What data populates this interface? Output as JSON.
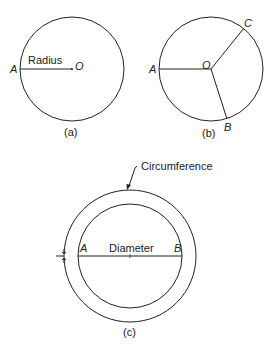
{
  "figure_a": {
    "label_radius": "Radius",
    "point_a": "A",
    "point_o": "O",
    "caption": "(a)"
  },
  "figure_b": {
    "point_a": "A",
    "point_o": "O",
    "point_b": "B",
    "point_c": "C",
    "caption": "(b)"
  },
  "figure_c": {
    "label_circumference": "Circumference",
    "label_diameter": "Diameter",
    "point_a": "A",
    "point_b": "B",
    "caption": "(c)"
  },
  "colors": {
    "stroke": "#222222",
    "background": "#ffffff"
  }
}
